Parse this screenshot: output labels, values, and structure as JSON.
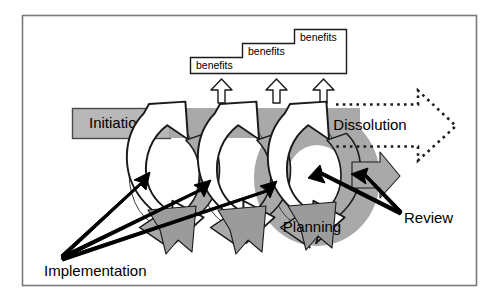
{
  "diagram": {
    "frame": {
      "border_color": "#7a7a7a",
      "background": "#ffffff"
    },
    "palette": {
      "outline": "#1a1a1a",
      "gray_fill": "#a9a9a9",
      "gray_fill_dark": "#9b9b9b",
      "label_box_fill": "#b8b8b8",
      "white_fill": "#ffffff",
      "arrow_black": "#000000",
      "frame_border": "#7a7a7a"
    },
    "benefits_staircase": {
      "label": "benefits-staircase",
      "steps": [
        {
          "text": "benefits",
          "level": 1
        },
        {
          "text": "benefits",
          "level": 2
        },
        {
          "text": "benefits",
          "level": 3
        }
      ]
    },
    "up_arrows": {
      "count": 3,
      "name": "benefit-realisation-arrow",
      "fill": "#ffffff",
      "stroke": "#1a1a1a"
    },
    "phase_labels": {
      "initiation": "Initiation",
      "dissolution": "Dissolution",
      "planning": "Planning"
    },
    "callout_labels": {
      "implementation": "Implementation",
      "review": "Review"
    },
    "cycles": {
      "count": 3,
      "name": "project-cycle"
    },
    "dissolution_arrow": {
      "style": "dotted-outline",
      "direction": "right"
    },
    "implementation_arrows": {
      "count": 3,
      "direction": "up-right"
    },
    "review_arrows": {
      "count": 2,
      "direction": "up-left"
    }
  }
}
